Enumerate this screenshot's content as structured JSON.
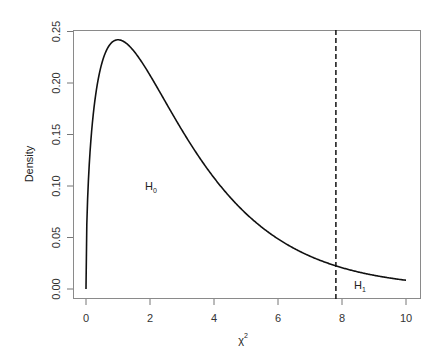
{
  "chart_data": {
    "type": "line",
    "title": "",
    "xlabel": "χ",
    "xlabel_superscript": "2",
    "ylabel": "Density",
    "xlim": [
      0,
      10
    ],
    "ylim": [
      0,
      0.25
    ],
    "grid": false,
    "legend": "none",
    "x_ticks": [
      "0",
      "2",
      "4",
      "6",
      "8",
      "10"
    ],
    "y_ticks": [
      "0.00",
      "0.05",
      "0.10",
      "0.15",
      "0.20",
      "0.25"
    ],
    "series": [
      {
        "name": "Chi-square density (df = 3)",
        "x": [
          0,
          0.25,
          0.5,
          1,
          1.5,
          2,
          3,
          4,
          5,
          6,
          7,
          8,
          9,
          10
        ],
        "y": [
          0,
          0.176,
          0.22,
          0.242,
          0.231,
          0.208,
          0.154,
          0.108,
          0.073,
          0.049,
          0.032,
          0.021,
          0.013,
          0.0085
        ]
      }
    ],
    "critical_value": {
      "x": 7.81,
      "style": "dashed"
    },
    "annotations": [
      {
        "text": "H",
        "subscript": "0",
        "x": 2.0,
        "y": 0.1
      },
      {
        "text": "H",
        "subscript": "1",
        "x": 8.5,
        "y": 0.004
      }
    ],
    "colors": {
      "line": "#111111",
      "axis": "#777777",
      "text": "#333333"
    }
  }
}
